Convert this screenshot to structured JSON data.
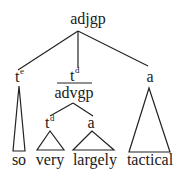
{
  "diagram": {
    "type": "syntax-tree",
    "root": {
      "label": "adjgp",
      "children": [
        {
          "label": "t",
          "superscript": "e",
          "terminal_triangle": true,
          "word": "so"
        },
        {
          "label": "t",
          "superscript": "d",
          "overbar_label": "advgp",
          "children": [
            {
              "label": "t",
              "superscript": "d",
              "terminal_triangle": true,
              "word": "very"
            },
            {
              "label": "a",
              "terminal_triangle": true,
              "word": "largely"
            }
          ]
        },
        {
          "label": "a",
          "terminal_triangle": true,
          "word": "tactical"
        }
      ]
    }
  },
  "nodes": {
    "root": "adjgp",
    "te_base": "t",
    "te_sup": "e",
    "td_base": "t",
    "td_sup": "d",
    "advgp": "advgp",
    "a_right": "a",
    "td_inner_base": "t",
    "td_inner_sup": "d",
    "a_inner": "a"
  },
  "words": {
    "so": "so",
    "very": "very",
    "largely": "largely",
    "tactical": "tactical"
  },
  "colors": {
    "ink": "#1a1a1a",
    "background": "#ffffff"
  }
}
